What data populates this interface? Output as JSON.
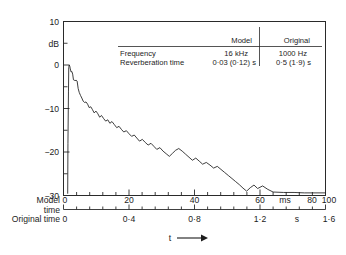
{
  "figure": {
    "ylabel": "dB",
    "t_label": "t",
    "arrow_icon": "right-arrow-icon",
    "model_time_label_line1": "Model",
    "model_time_label_line2": "time",
    "original_time_label": "Original time",
    "model_unit": "ms",
    "original_unit": "s"
  },
  "table": {
    "columns": [
      "",
      "Model",
      "Original"
    ],
    "rows": [
      {
        "label": "Frequency",
        "model": "16 kHz",
        "original": "1000 Hz"
      },
      {
        "label": "Reverberation time",
        "model": "0·03 (0·12) s",
        "original": "0·5 (1·9) s"
      }
    ]
  },
  "chart_data": {
    "type": "line",
    "title": "",
    "xlabel": "t",
    "ylabel": "dB",
    "grid": false,
    "legend": "none",
    "axes": {
      "y": {
        "label": "dB",
        "ticks": [
          10,
          0,
          -10,
          -20,
          -30
        ],
        "ticklabels": [
          "10",
          "0",
          "−10",
          "−20",
          "−30"
        ],
        "minor_step": 5,
        "ylim": [
          -30,
          10
        ]
      },
      "x_model": {
        "name": "Model time",
        "unit": "ms",
        "ticks": [
          0,
          20,
          40,
          60,
          80,
          100
        ],
        "ticklabels": [
          "0",
          "20",
          "40",
          "60",
          "80",
          "100"
        ],
        "minor_step": 5,
        "xlim": [
          0,
          100
        ]
      },
      "x_original": {
        "name": "Original time",
        "unit": "s",
        "ticks": [
          0,
          0.4,
          0.8,
          1.2,
          1.6
        ],
        "ticklabels": [
          "0",
          "0·4",
          "0·8",
          "1·2",
          "1·6"
        ],
        "minor_step": 0.1,
        "xlim": [
          0,
          1.6
        ]
      }
    },
    "series": [
      {
        "name": "reverberation decay",
        "x_unit": "ms",
        "y_unit": "dB",
        "x": [
          1.6,
          1.7,
          1.9,
          2.0,
          2.2,
          2.4,
          2.6,
          2.9,
          3.2,
          3.5,
          3.8,
          4.1,
          4.4,
          4.8,
          5.2,
          5.6,
          6.0,
          6.5,
          7.0,
          7.5,
          8.0,
          8.6,
          9.2,
          9.8,
          10.4,
          11.0,
          11.7,
          12.4,
          13.1,
          13.8,
          14.5,
          15.3,
          16.1,
          16.9,
          17.7,
          18.5,
          19.4,
          20.3,
          21.2,
          22.1,
          23.0,
          24.0,
          25.0,
          26.0,
          27.0,
          28.0,
          29.0,
          30.1,
          31.2,
          32.3,
          33.4,
          34.5,
          35.6,
          36.8,
          38.0,
          39.2,
          40.4,
          41.6,
          42.8,
          44.0,
          45.3,
          46.6,
          47.9,
          49.2,
          50.5,
          51.8,
          53.1,
          54.5,
          55.9,
          57.3,
          58.7,
          60.1,
          61.5,
          62.9,
          64.3,
          65.7,
          67.1,
          68.5,
          69.9,
          71.3,
          72.7,
          74.1,
          76.0,
          78.0,
          80.0,
          84.0,
          88.0,
          92.0,
          96.0,
          100.0
        ],
        "y": [
          -29.5,
          -18.0,
          -6.0,
          -0.6,
          0.0,
          -0.3,
          -0.9,
          -1.6,
          -1.5,
          -2.1,
          -3.4,
          -3.5,
          -3.6,
          -3.5,
          -3.7,
          -5.4,
          -6.3,
          -7.0,
          -7.6,
          -8.3,
          -8.6,
          -8.5,
          -9.0,
          -9.8,
          -9.6,
          -10.2,
          -11.0,
          -10.6,
          -11.2,
          -12.0,
          -11.6,
          -12.3,
          -12.9,
          -12.6,
          -13.4,
          -13.0,
          -13.7,
          -14.4,
          -14.1,
          -14.8,
          -15.4,
          -15.1,
          -15.8,
          -16.4,
          -16.1,
          -16.8,
          -17.5,
          -17.1,
          -17.8,
          -18.4,
          -18.0,
          -18.7,
          -19.4,
          -19.0,
          -19.8,
          -20.4,
          -21.0,
          -20.3,
          -19.6,
          -19.2,
          -19.8,
          -20.5,
          -21.2,
          -21.9,
          -21.4,
          -22.1,
          -22.8,
          -22.4,
          -23.0,
          -23.7,
          -23.3,
          -24.0,
          -24.7,
          -25.4,
          -26.1,
          -26.8,
          -27.5,
          -28.3,
          -29.0,
          -28.2,
          -27.6,
          -28.4,
          -27.8,
          -28.6,
          -29.2,
          -29.3,
          -29.3,
          -29.4,
          -29.4,
          -29.4
        ]
      }
    ]
  }
}
